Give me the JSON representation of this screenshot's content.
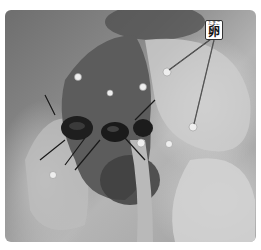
{
  "figure": {
    "label": {
      "ruby": "たまご",
      "text": "卵"
    },
    "leader_targets": [
      {
        "x": 167,
        "y": 71
      },
      {
        "x": 193,
        "y": 127
      }
    ],
    "colors": {
      "background": "#ffffff",
      "photo_dark": "#3a3a3a",
      "photo_light": "#d8d8d8",
      "label_border": "#333333"
    }
  }
}
